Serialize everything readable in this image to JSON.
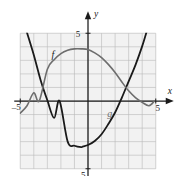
{
  "figure": {
    "kind": "cartesian-graph",
    "background": "#ffffff",
    "grid_fill": "#f2f2f2",
    "grid_line_color": "#b9b9b9",
    "axis_color": "#1a1a1a",
    "curve_f_color": "#1a1a1a",
    "curve_g_color": "#6e6e6e"
  },
  "axes": {
    "x_axis_label": "x",
    "y_axis_label": "y",
    "x_min": -5,
    "x_max": 5,
    "y_min": -5,
    "y_max": 5,
    "grid_step": 1,
    "grid": true,
    "ticks": {
      "x_left_label": "–5",
      "x_right_label": "5",
      "y_top_label": "5",
      "y_bottom_label": "–5"
    }
  },
  "curves": [
    {
      "name": "f",
      "label": "f",
      "label_x": -2.6,
      "label_y": 3.2,
      "stroke": "#1a1a1a",
      "stroke_width": 1.7,
      "shape": "parabola-opening-up",
      "vertex": [
        -0.35,
        -3.35
      ],
      "x_intercepts": [
        -2.1,
        3.1
      ],
      "note": "steep upward parabola entering at top-left and top-right of the window"
    },
    {
      "name": "g",
      "label": "g",
      "label_x": 1.6,
      "label_y": -1.2,
      "stroke": "#6e6e6e",
      "stroke_width": 1.7,
      "shape": "rising-then-falling-arch",
      "maximum": [
        -0.1,
        3.8
      ],
      "x_intercepts": [
        -3.6,
        4.9
      ],
      "note": "broad arch peaking just left of the y-axis, descending to the right edge"
    }
  ],
  "chart_data": {
    "type": "line",
    "title": "",
    "xlabel": "x",
    "ylabel": "y",
    "xlim": [
      -5,
      5
    ],
    "ylim": [
      -5,
      5
    ],
    "grid": true,
    "legend": "inline-curve-labels",
    "series": [
      {
        "name": "f",
        "color": "#1a1a1a",
        "points": [
          [
            -4.55,
            5.2
          ],
          [
            -4.0,
            3.4
          ],
          [
            -3.5,
            1.55
          ],
          [
            -3.0,
            0.05
          ],
          [
            -2.5,
            -1.25
          ],
          [
            -2.1,
            0.0
          ],
          [
            -2.0,
            -2.3
          ],
          [
            -1.5,
            -3.0
          ],
          [
            -1.0,
            -3.3
          ],
          [
            -0.5,
            -3.4
          ],
          [
            -0.35,
            -3.35
          ],
          [
            0.0,
            -3.25
          ],
          [
            0.5,
            -2.95
          ],
          [
            1.0,
            -2.45
          ],
          [
            1.5,
            -1.7
          ],
          [
            2.0,
            -0.85
          ],
          [
            2.5,
            0.25
          ],
          [
            3.1,
            0.0
          ],
          [
            3.0,
            1.45
          ],
          [
            3.5,
            2.65
          ],
          [
            4.0,
            4.05
          ],
          [
            4.35,
            5.2
          ]
        ],
        "note": "x-intercepts at about x = -2.1 and x = 3.1; vertex about (-0.35, -3.35)"
      },
      {
        "name": "g",
        "color": "#6e6e6e",
        "points": [
          [
            -5.0,
            -0.9
          ],
          [
            -4.5,
            -0.35
          ],
          [
            -4.0,
            0.6
          ],
          [
            -3.6,
            0.0
          ],
          [
            -3.5,
            1.45
          ],
          [
            -3.0,
            2.35
          ],
          [
            -2.5,
            3.05
          ],
          [
            -2.0,
            3.5
          ],
          [
            -1.5,
            3.75
          ],
          [
            -1.0,
            3.85
          ],
          [
            -0.5,
            3.85
          ],
          [
            0.0,
            3.8
          ],
          [
            0.5,
            3.55
          ],
          [
            1.0,
            3.2
          ],
          [
            1.5,
            2.7
          ],
          [
            2.0,
            2.1
          ],
          [
            2.5,
            1.4
          ],
          [
            3.0,
            0.75
          ],
          [
            3.5,
            0.25
          ],
          [
            4.0,
            -0.1
          ],
          [
            4.5,
            -0.35
          ],
          [
            4.9,
            0.0
          ],
          [
            5.0,
            -0.45
          ]
        ],
        "note": "peak about (−0.3, 3.85); crosses x-axis near x = −3.6 and flattens near the right edge"
      }
    ]
  }
}
